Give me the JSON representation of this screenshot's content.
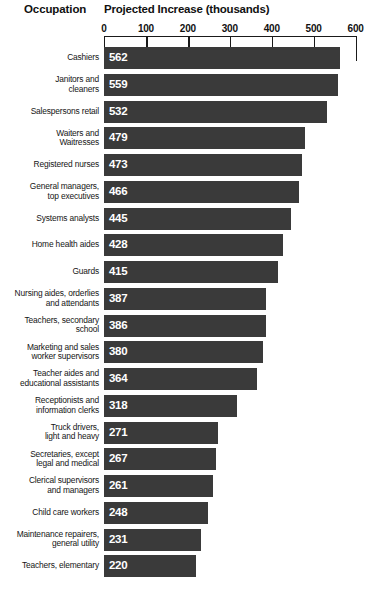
{
  "headers": {
    "occupation": "Occupation",
    "value": "Projected Increase (thousands)"
  },
  "chart_data": {
    "type": "bar",
    "orientation": "horizontal",
    "title": "Projected Increase (thousands)",
    "xlabel": "Projected Increase (thousands)",
    "ylabel": "Occupation",
    "xlim": [
      0,
      600
    ],
    "ticks": [
      0,
      100,
      200,
      300,
      400,
      500,
      600
    ],
    "tick_labels": [
      "0",
      "100",
      "200",
      "300",
      "400",
      "500",
      "600"
    ],
    "grid": true,
    "legend": false,
    "bar_color": "#3a3a3a",
    "value_label_color": "#ffffff",
    "categories": [
      "Cashiers",
      "Janitors and cleaners",
      "Salespersons retail",
      "Waiters and Waitresses",
      "Registered nurses",
      "General managers, top executives",
      "Systems analysts",
      "Home health aides",
      "Guards",
      "Nursing aides, orderlies and attendants",
      "Teachers, secondary school",
      "Marketing and sales worker supervisors",
      "Teacher aides and educational assistants",
      "Receptionists and information clerks",
      "Truck drivers, light and heavy",
      "Secretaries, except legal and medical",
      "Clerical supervisors and managers",
      "Child care workers",
      "Maintenance repairers, general utility",
      "Teachers, elementary"
    ],
    "values": [
      562,
      559,
      532,
      479,
      473,
      466,
      445,
      428,
      415,
      387,
      386,
      380,
      364,
      318,
      271,
      267,
      261,
      248,
      231,
      220
    ]
  },
  "rows": [
    {
      "label_lines": [
        "Cashiers"
      ],
      "value": 562,
      "value_text": "562"
    },
    {
      "label_lines": [
        "Janitors and",
        "cleaners"
      ],
      "value": 559,
      "value_text": "559"
    },
    {
      "label_lines": [
        "Salespersons retail"
      ],
      "value": 532,
      "value_text": "532"
    },
    {
      "label_lines": [
        "Waiters and",
        "Waitresses"
      ],
      "value": 479,
      "value_text": "479"
    },
    {
      "label_lines": [
        "Registered nurses"
      ],
      "value": 473,
      "value_text": "473"
    },
    {
      "label_lines": [
        "General managers,",
        "top executives"
      ],
      "value": 466,
      "value_text": "466"
    },
    {
      "label_lines": [
        "Systems analysts"
      ],
      "value": 445,
      "value_text": "445"
    },
    {
      "label_lines": [
        "Home health aides"
      ],
      "value": 428,
      "value_text": "428"
    },
    {
      "label_lines": [
        "Guards"
      ],
      "value": 415,
      "value_text": "415"
    },
    {
      "label_lines": [
        "Nursing aides, orderlies",
        "and attendants"
      ],
      "value": 387,
      "value_text": "387"
    },
    {
      "label_lines": [
        "Teachers, secondary",
        "school"
      ],
      "value": 386,
      "value_text": "386"
    },
    {
      "label_lines": [
        "Marketing and sales",
        "worker supervisors"
      ],
      "value": 380,
      "value_text": "380"
    },
    {
      "label_lines": [
        "Teacher aides and",
        "educational assistants"
      ],
      "value": 364,
      "value_text": "364"
    },
    {
      "label_lines": [
        "Receptionists and",
        "information clerks"
      ],
      "value": 318,
      "value_text": "318"
    },
    {
      "label_lines": [
        "Truck drivers,",
        "light and heavy"
      ],
      "value": 271,
      "value_text": "271"
    },
    {
      "label_lines": [
        "Secretaries, except",
        "legal and medical"
      ],
      "value": 267,
      "value_text": "267"
    },
    {
      "label_lines": [
        "Clerical supervisors",
        "and managers"
      ],
      "value": 261,
      "value_text": "261"
    },
    {
      "label_lines": [
        "Child care workers"
      ],
      "value": 248,
      "value_text": "248"
    },
    {
      "label_lines": [
        "Maintenance repairers,",
        "general utility"
      ],
      "value": 231,
      "value_text": "231"
    },
    {
      "label_lines": [
        "Teachers, elementary"
      ],
      "value": 220,
      "value_text": "220"
    }
  ]
}
